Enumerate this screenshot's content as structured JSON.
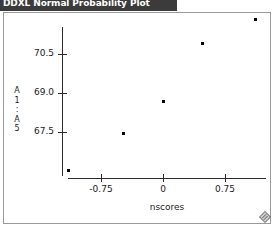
{
  "window": {
    "title": "DDXL Normal Probability Plot",
    "grip_icon": "resize-grip-icon"
  },
  "chart_data": {
    "type": "scatter",
    "title": "DDXL Normal Probability Plot",
    "xlabel": "nscores",
    "ylabel": "A1:A5",
    "ylabel_chars": [
      "A",
      "1",
      ":",
      "A",
      "5"
    ],
    "x": [
      -1.06,
      -0.36,
      0.0,
      0.47,
      1.12
    ],
    "y": [
      66.05,
      67.45,
      68.7,
      70.9,
      71.85
    ],
    "points": [
      {
        "x": -1.06,
        "y": 66.05
      },
      {
        "x": -0.36,
        "y": 67.45
      },
      {
        "x": 0.0,
        "y": 68.7
      },
      {
        "x": 0.47,
        "y": 70.9
      },
      {
        "x": 1.12,
        "y": 71.85
      }
    ],
    "xticks": [
      -0.75,
      0,
      0.75
    ],
    "xticklabels": [
      "-0.75",
      "0",
      "0.75"
    ],
    "yticks": [
      67.5,
      69.0,
      70.5
    ],
    "yticklabels": [
      "67.5",
      "69.0",
      "70.5"
    ],
    "xlim": [
      -1.2,
      1.35
    ],
    "ylim": [
      65.6,
      72.3
    ],
    "grid": false,
    "legend": null,
    "marker": "square",
    "marker_color": "#000000"
  },
  "geometry": {
    "plot_left": 68,
    "plot_right": 266,
    "x_axis_y": 178,
    "y_axis_x": 62,
    "y_axis_top": 27,
    "y_axis_bottom": 176,
    "xtick_px": [
      101,
      163,
      225
    ],
    "ytick_px": [
      132,
      93,
      54
    ],
    "point_px": [
      {
        "x": 68,
        "y": 170
      },
      {
        "x": 123,
        "y": 133
      },
      {
        "x": 163,
        "y": 101
      },
      {
        "x": 202,
        "y": 43
      },
      {
        "x": 255,
        "y": 19
      }
    ]
  }
}
